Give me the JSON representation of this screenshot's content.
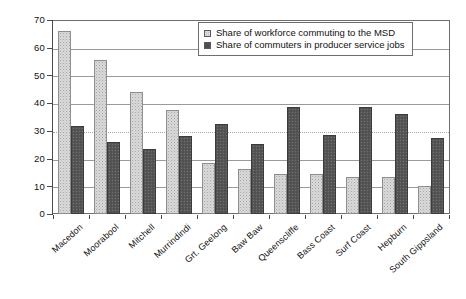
{
  "chart_data": {
    "type": "bar",
    "title": "",
    "subtitle": "",
    "xlabel": "",
    "ylabel": "",
    "ylim": [
      0,
      70
    ],
    "yticks": [
      0,
      10,
      20,
      30,
      40,
      50,
      60,
      70
    ],
    "grid": true,
    "legend_position": "top-right",
    "categories": [
      "Macedon",
      "Moorabool",
      "Mitchell",
      "Murrindindi",
      "Grt. Geelong",
      "Baw Baw",
      "Queenscliffe",
      "Bass Coast",
      "Surf Coast",
      "Hepburn",
      "South Gippsland"
    ],
    "series": [
      {
        "name": "Share of workforce commuting to the MSD",
        "color": "#d9d9d9",
        "values": [
          66.3,
          56.0,
          44.3,
          37.7,
          18.5,
          16.5,
          14.4,
          14.4,
          13.6,
          13.6,
          10.3
        ]
      },
      {
        "name": "Share of commuters in producer service jobs",
        "color": "#565656",
        "values": [
          32.0,
          26.1,
          23.6,
          28.4,
          32.5,
          25.5,
          38.8,
          28.6,
          38.8,
          36.3,
          27.7
        ]
      }
    ]
  },
  "legend": {
    "items": [
      {
        "label": "Share of workforce commuting to the MSD",
        "swatch": "light"
      },
      {
        "label": "Share of commuters in producer service jobs",
        "swatch": "dark"
      }
    ]
  },
  "axis": {
    "y_tick_labels": [
      "70",
      "60",
      "50",
      "40",
      "30",
      "20",
      "10",
      "0"
    ]
  }
}
